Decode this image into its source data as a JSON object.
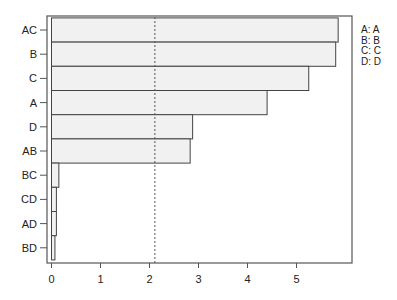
{
  "chart_data": {
    "type": "bar",
    "orientation": "horizontal",
    "title": "",
    "xlabel": "",
    "ylabel": "",
    "categories": [
      "AC",
      "B",
      "C",
      "A",
      "D",
      "AB",
      "BC",
      "CD",
      "AD",
      "BD"
    ],
    "values": [
      5.85,
      5.8,
      5.25,
      4.4,
      2.88,
      2.83,
      0.15,
      0.1,
      0.1,
      0.07
    ],
    "xlim": [
      0,
      6.1
    ],
    "xticks": [
      "0",
      "1",
      "2",
      "3",
      "4",
      "5"
    ],
    "reference_line": {
      "value": 2.11,
      "style": "dashed"
    },
    "grid": false,
    "legend": {
      "placement": "right",
      "entries": [
        {
          "key": "A:",
          "label": "A"
        },
        {
          "key": "B:",
          "label": "B"
        },
        {
          "key": "C:",
          "label": "C"
        },
        {
          "key": "D:",
          "label": "D"
        }
      ]
    },
    "colors": {
      "bar_fill": "#f1f1f1",
      "bar_stroke": "#444444",
      "axis": "#555555"
    }
  }
}
